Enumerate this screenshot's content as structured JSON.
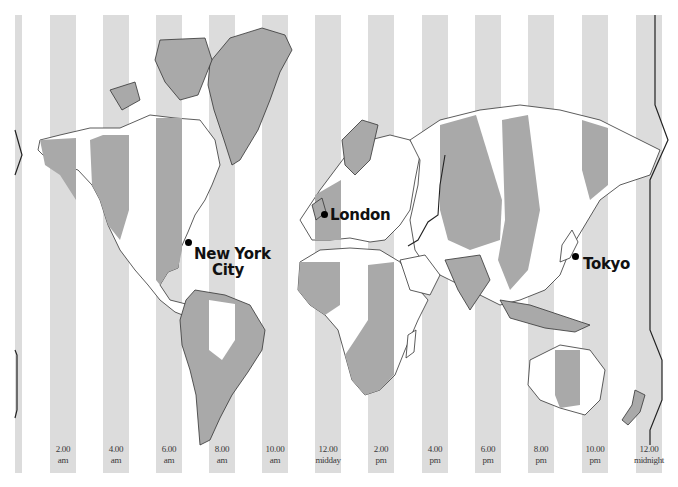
{
  "map": {
    "title": "World time zones",
    "colors": {
      "stripe": "#dcdcdc",
      "land_dark": "#a9a9a9",
      "land_light": "#ffffff",
      "coast": "#333333",
      "dateline": "#222222",
      "label": "#3a3a3a"
    },
    "time_labels": [
      {
        "time": "2.00",
        "period": "am"
      },
      {
        "time": "4.00",
        "period": "am"
      },
      {
        "time": "6.00",
        "period": "am"
      },
      {
        "time": "8.00",
        "period": "am"
      },
      {
        "time": "10.00",
        "period": "am"
      },
      {
        "time": "12.00",
        "period": "midday"
      },
      {
        "time": "2.00",
        "period": "pm"
      },
      {
        "time": "4.00",
        "period": "pm"
      },
      {
        "time": "6.00",
        "period": "pm"
      },
      {
        "time": "8.00",
        "period": "pm"
      },
      {
        "time": "10.00",
        "period": "pm"
      },
      {
        "time": "12.00",
        "period": "midnight"
      }
    ],
    "cities": [
      {
        "name_line1": "New York",
        "name_line2": "City"
      },
      {
        "name_line1": "London"
      },
      {
        "name_line1": "Tokyo"
      }
    ],
    "features": {
      "dateline": "International Date Line"
    }
  }
}
